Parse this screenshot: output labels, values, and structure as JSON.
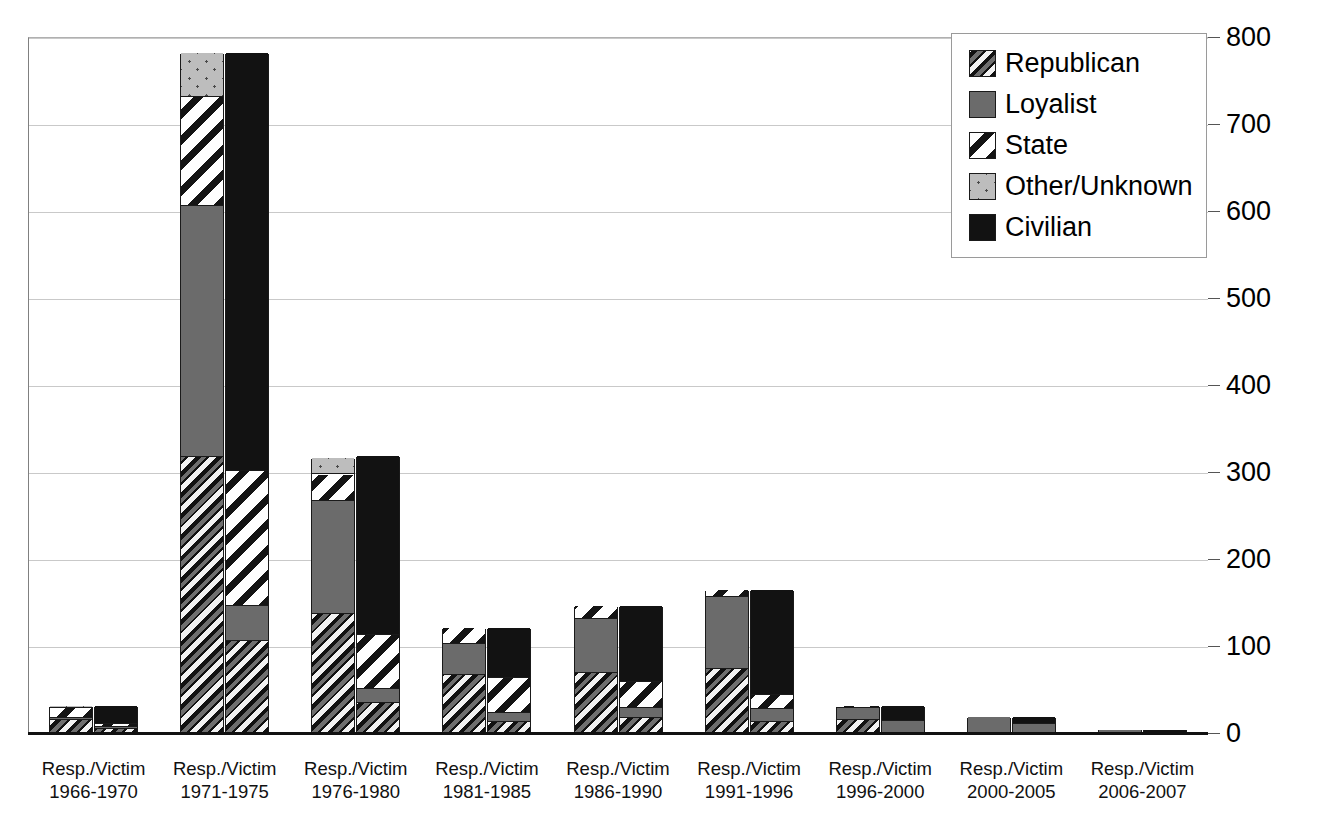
{
  "chart_data": {
    "type": "bar",
    "title": "",
    "xlabel": "",
    "ylabel": "",
    "ylim": [
      0,
      800
    ],
    "ytick_step": 100,
    "yticks": [
      0,
      100,
      200,
      300,
      400,
      500,
      600,
      700,
      800
    ],
    "ytick_labels": [
      "0",
      "100",
      "200",
      "300",
      "400",
      "500",
      "600",
      "700",
      "800"
    ],
    "grid": true,
    "y_axis_position": "right",
    "stacked": true,
    "legend_position": "top-right",
    "legend": [
      "Republican",
      "Loyalist",
      "State",
      "Other/Unknown",
      "Civilian"
    ],
    "bar_pair_labels": [
      "Resp.",
      "Victim"
    ],
    "categories": [
      "Resp./Victim 1966-1970",
      "Resp./Victim 1971-1975",
      "Resp./Victim 1976-1980",
      "Resp./Victim 1981-1985",
      "Resp./Victim 1986-1990",
      "Resp./Victim 1991-1996",
      "Resp./Victim 1996-2000",
      "Resp./Victim 2000-2005",
      "Resp./Victim 2006-2007"
    ],
    "category_lines": [
      [
        "Resp./Victim",
        "1966-1970"
      ],
      [
        "Resp./Victim",
        "1971-1975"
      ],
      [
        "Resp./Victim",
        "1976-1980"
      ],
      [
        "Resp./Victim",
        "1981-1985"
      ],
      [
        "Resp./Victim",
        "1986-1990"
      ],
      [
        "Resp./Victim",
        "1991-1996"
      ],
      [
        "Resp./Victim",
        "1996-2000"
      ],
      [
        "Resp./Victim",
        "2000-2005"
      ],
      [
        "Resp./Victim",
        "2006-2007"
      ]
    ],
    "groups": [
      {
        "category": "Resp./Victim 1966-1970",
        "bars": [
          {
            "role": "Responsible",
            "total": 30,
            "segments": [
              {
                "name": "Republican",
                "value": 14
              },
              {
                "name": "Loyalist",
                "value": 2
              },
              {
                "name": "State",
                "value": 12
              },
              {
                "name": "Other/Unknown",
                "value": 2
              }
            ]
          },
          {
            "role": "Victim",
            "total": 30,
            "segments": [
              {
                "name": "Republican",
                "value": 4
              },
              {
                "name": "Loyalist",
                "value": 2
              },
              {
                "name": "State",
                "value": 3
              },
              {
                "name": "Civilian",
                "value": 21
              }
            ]
          }
        ]
      },
      {
        "category": "Resp./Victim 1971-1975",
        "bars": [
          {
            "role": "Responsible",
            "total": 780,
            "segments": [
              {
                "name": "Republican",
                "value": 316
              },
              {
                "name": "Loyalist",
                "value": 289
              },
              {
                "name": "State",
                "value": 125
              },
              {
                "name": "Other/Unknown",
                "value": 50
              }
            ]
          },
          {
            "role": "Victim",
            "total": 780,
            "segments": [
              {
                "name": "Republican",
                "value": 105
              },
              {
                "name": "Loyalist",
                "value": 40
              },
              {
                "name": "State",
                "value": 155
              },
              {
                "name": "Civilian",
                "value": 480
              }
            ]
          }
        ]
      },
      {
        "category": "Resp./Victim 1976-1980",
        "bars": [
          {
            "role": "Responsible",
            "total": 315,
            "segments": [
              {
                "name": "Republican",
                "value": 136
              },
              {
                "name": "Loyalist",
                "value": 130
              },
              {
                "name": "State",
                "value": 30
              },
              {
                "name": "Other/Unknown",
                "value": 19
              }
            ]
          },
          {
            "role": "Victim",
            "total": 317,
            "segments": [
              {
                "name": "Republican",
                "value": 33
              },
              {
                "name": "Loyalist",
                "value": 17
              },
              {
                "name": "State",
                "value": 62
              },
              {
                "name": "Civilian",
                "value": 205
              }
            ]
          }
        ]
      },
      {
        "category": "Resp./Victim 1981-1985",
        "bars": [
          {
            "role": "Responsible",
            "total": 120,
            "segments": [
              {
                "name": "Republican",
                "value": 65
              },
              {
                "name": "Loyalist",
                "value": 36
              },
              {
                "name": "State",
                "value": 19
              }
            ]
          },
          {
            "role": "Victim",
            "total": 120,
            "segments": [
              {
                "name": "Republican",
                "value": 12
              },
              {
                "name": "Loyalist",
                "value": 10
              },
              {
                "name": "State",
                "value": 40
              },
              {
                "name": "Civilian",
                "value": 58
              }
            ]
          }
        ]
      },
      {
        "category": "Resp./Victim 1986-1990",
        "bars": [
          {
            "role": "Responsible",
            "total": 145,
            "segments": [
              {
                "name": "Republican",
                "value": 68
              },
              {
                "name": "Loyalist",
                "value": 62
              },
              {
                "name": "State",
                "value": 15
              }
            ]
          },
          {
            "role": "Victim",
            "total": 145,
            "segments": [
              {
                "name": "Republican",
                "value": 16
              },
              {
                "name": "Loyalist",
                "value": 12
              },
              {
                "name": "State",
                "value": 30
              },
              {
                "name": "Civilian",
                "value": 87
              }
            ]
          }
        ]
      },
      {
        "category": "Resp./Victim 1991-1996",
        "bars": [
          {
            "role": "Responsible",
            "total": 163,
            "segments": [
              {
                "name": "Republican",
                "value": 72
              },
              {
                "name": "Loyalist",
                "value": 83
              },
              {
                "name": "State",
                "value": 8
              }
            ]
          },
          {
            "role": "Victim",
            "total": 163,
            "segments": [
              {
                "name": "Republican",
                "value": 12
              },
              {
                "name": "Loyalist",
                "value": 14
              },
              {
                "name": "State",
                "value": 16
              },
              {
                "name": "Civilian",
                "value": 121
              }
            ]
          }
        ]
      },
      {
        "category": "Resp./Victim 1996-2000",
        "bars": [
          {
            "role": "Responsible",
            "total": 30,
            "segments": [
              {
                "name": "Republican",
                "value": 14
              },
              {
                "name": "Loyalist",
                "value": 14
              },
              {
                "name": "State",
                "value": 2
              }
            ]
          },
          {
            "role": "Victim",
            "total": 30,
            "segments": [
              {
                "name": "Loyalist",
                "value": 13
              },
              {
                "name": "Civilian",
                "value": 17
              }
            ]
          }
        ]
      },
      {
        "category": "Resp./Victim 2000-2005",
        "bars": [
          {
            "role": "Responsible",
            "total": 17,
            "segments": [
              {
                "name": "Loyalist",
                "value": 17
              }
            ]
          },
          {
            "role": "Victim",
            "total": 17,
            "segments": [
              {
                "name": "Loyalist",
                "value": 9
              },
              {
                "name": "Civilian",
                "value": 8
              }
            ]
          }
        ]
      },
      {
        "category": "Resp./Victim 2006-2007",
        "bars": [
          {
            "role": "Responsible",
            "total": 2,
            "segments": [
              {
                "name": "Loyalist",
                "value": 2
              }
            ]
          },
          {
            "role": "Victim",
            "total": 2,
            "segments": [
              {
                "name": "Civilian",
                "value": 2
              }
            ]
          }
        ]
      }
    ]
  },
  "legend": {
    "items": [
      {
        "label": "Republican",
        "pattern": "diagonal-hatch-dark"
      },
      {
        "label": "Loyalist",
        "pattern": "solid-gray"
      },
      {
        "label": "State",
        "pattern": "diagonal-hatch-white"
      },
      {
        "label": "Other/Unknown",
        "pattern": "light-dotted"
      },
      {
        "label": "Civilian",
        "pattern": "solid-black"
      }
    ]
  },
  "colors": {
    "republican": "#6e6e6e",
    "loyalist": "#6b6b6b",
    "state": "#ffffff",
    "other_unknown": "#bdbdbd",
    "civilian": "#121212",
    "gridline": "#c9c9c9",
    "axis": "#111111"
  }
}
